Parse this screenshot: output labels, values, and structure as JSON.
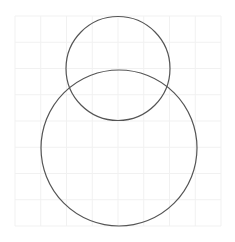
{
  "diagram": {
    "background": "#ffffff",
    "grid": {
      "x0": 15,
      "y0": 16,
      "x1": 221,
      "y1": 226,
      "cols": 8,
      "rows": 8,
      "color": "#f1f1f1"
    },
    "circles": [
      {
        "name": "small-circle",
        "cx": 118,
        "cy": 68.5,
        "r": 52,
        "stroke": "#555555"
      },
      {
        "name": "large-circle",
        "cx": 119,
        "cy": 148,
        "r": 78,
        "stroke": "#555555"
      }
    ]
  }
}
